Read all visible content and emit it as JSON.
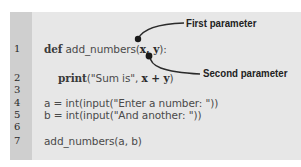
{
  "code_listing": {
    "lines": [
      {
        "number": "1",
        "segments": [
          {
            "text": "def",
            "style": "keyword"
          },
          {
            "text": " add_numbers(",
            "style": "plain"
          },
          {
            "text": "x, y",
            "style": "param"
          },
          {
            "text": "):",
            "style": "plain"
          }
        ]
      },
      {
        "number": "2",
        "segments": [
          {
            "text": "   print",
            "style": "keyword"
          },
          {
            "text": "(\"Sum is\", ",
            "style": "plain"
          },
          {
            "text": "x + y",
            "style": "param"
          },
          {
            "text": ")",
            "style": "plain"
          }
        ]
      },
      {
        "number": "3",
        "segments": []
      },
      {
        "number": "4",
        "segments": [
          {
            "text": "a = int(input(\"Enter a number: \"))",
            "style": "plain"
          }
        ]
      },
      {
        "number": "5",
        "segments": [
          {
            "text": "b = int(input(\"And another: \"))",
            "style": "plain"
          }
        ]
      },
      {
        "number": "6",
        "segments": []
      },
      {
        "number": "7",
        "segments": [
          {
            "text": "add_numbers(a, b)",
            "style": "plain"
          }
        ]
      }
    ]
  },
  "labels": {
    "l1_kw": "def",
    "l1_name": " add_numbers(",
    "l1_params": "x, y",
    "l1_end": "):",
    "l2_kw": "print",
    "l2_mid": "(\"Sum is\", ",
    "l2_params": "x + y",
    "l2_end": ")",
    "l4": "a = int(input(\"Enter a number: \"))",
    "l5": "b = int(input(\"And another: \"))",
    "l7": "add_numbers(a, b)"
  },
  "line_numbers": [
    "1",
    "2",
    "3",
    "4",
    "5",
    "6",
    "7"
  ],
  "annotations": {
    "first": "First parameter",
    "second": "Second parameter"
  },
  "colors": {
    "gutter": "#cfcfcf",
    "code_background": "#e7e7e7",
    "connector": "#2a2a2a",
    "label_text": "#222222"
  }
}
